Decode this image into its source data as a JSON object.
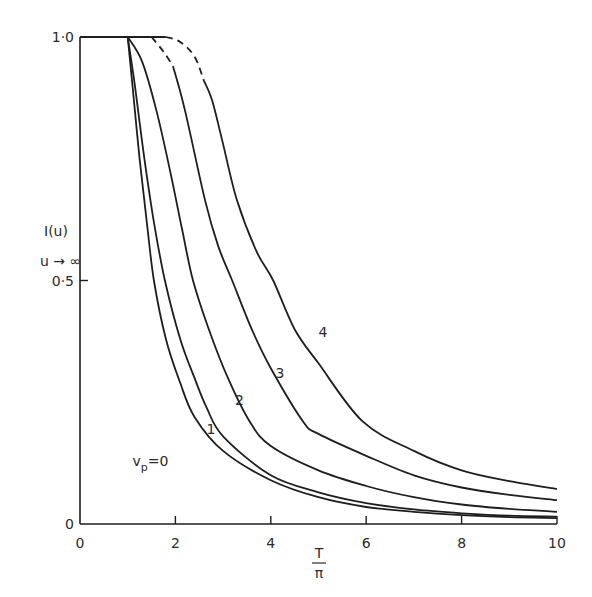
{
  "chart_data": {
    "type": "line",
    "title": "",
    "xlabel_num": "T",
    "xlabel_den": "π",
    "ylabel_line1": "I(u)",
    "ylabel_line2": "u → ∞",
    "xlim": [
      0,
      10
    ],
    "ylim": [
      0,
      1.0
    ],
    "grid": false,
    "x_ticks": [
      0,
      2,
      4,
      6,
      8,
      10
    ],
    "x_tick_labels": [
      "0",
      "2",
      "4",
      "6",
      "8",
      "10"
    ],
    "y_ticks": [
      0,
      0.5,
      1.0
    ],
    "y_tick_labels": [
      "0",
      "0·5",
      "1·0"
    ],
    "plateau": {
      "x": [
        0,
        1.8
      ],
      "y": 1.0
    },
    "series": [
      {
        "name": "v_p=0",
        "label": "vp=0",
        "style": "solid",
        "x": [
          1.0,
          1.1,
          1.25,
          1.4,
          1.55,
          1.8,
          2.1,
          2.4,
          3.0,
          4.0,
          5.0,
          6.0,
          7.0,
          8.0,
          9.0,
          10.0
        ],
        "y": [
          1.0,
          0.9,
          0.75,
          0.62,
          0.5,
          0.38,
          0.29,
          0.22,
          0.15,
          0.09,
          0.055,
          0.035,
          0.025,
          0.018,
          0.014,
          0.012
        ]
      },
      {
        "name": "v_p=1",
        "label": "1",
        "style": "solid",
        "x": [
          1.0,
          1.15,
          1.35,
          1.55,
          1.78,
          2.1,
          2.4,
          2.65,
          3.0,
          4.0,
          5.0,
          6.0,
          7.0,
          8.0,
          9.0,
          10.0
        ],
        "y": [
          1.0,
          0.9,
          0.75,
          0.62,
          0.5,
          0.38,
          0.3,
          0.24,
          0.18,
          0.1,
          0.065,
          0.043,
          0.03,
          0.022,
          0.017,
          0.015
        ]
      },
      {
        "name": "v_p=2",
        "label": "2",
        "style": "solid",
        "x": [
          1.0,
          1.3,
          1.6,
          1.9,
          2.15,
          2.37,
          2.7,
          3.1,
          3.56,
          4.0,
          5.0,
          6.0,
          7.0,
          8.0,
          9.0,
          10.0
        ],
        "y": [
          1.0,
          0.95,
          0.85,
          0.72,
          0.6,
          0.5,
          0.4,
          0.3,
          0.21,
          0.16,
          0.11,
          0.078,
          0.055,
          0.04,
          0.031,
          0.025
        ]
      },
      {
        "name": "v_p=3",
        "label": "3",
        "style": "solid",
        "dashed_prefix": {
          "x": [
            1.5,
            1.75,
            1.95
          ],
          "y": [
            1.0,
            0.97,
            0.94
          ]
        },
        "x": [
          1.95,
          2.2,
          2.62,
          2.9,
          3.19,
          3.6,
          4.0,
          4.68,
          5.0,
          6.0,
          7.0,
          8.0,
          9.0,
          10.0
        ],
        "y": [
          0.94,
          0.85,
          0.665,
          0.57,
          0.5,
          0.4,
          0.32,
          0.21,
          0.185,
          0.14,
          0.1,
          0.075,
          0.06,
          0.049
        ]
      },
      {
        "name": "v_p=4",
        "label": "4",
        "style": "solid",
        "dashed_prefix": {
          "x": [
            1.8,
            2.1,
            2.4,
            2.6
          ],
          "y": [
            1.0,
            0.99,
            0.96,
            0.91
          ]
        },
        "x": [
          2.6,
          2.77,
          3.0,
          3.29,
          3.7,
          4.05,
          4.5,
          5.0,
          5.93,
          7.0,
          8.0,
          9.0,
          10.0
        ],
        "y": [
          0.91,
          0.87,
          0.78,
          0.665,
          0.56,
          0.5,
          0.4,
          0.33,
          0.21,
          0.15,
          0.11,
          0.088,
          0.072
        ]
      }
    ],
    "annotations": [
      {
        "text": "vp=0",
        "x": 1.1,
        "y": 0.12
      },
      {
        "text": "1",
        "x": 2.65,
        "y": 0.185
      },
      {
        "text": "2",
        "x": 3.25,
        "y": 0.245
      },
      {
        "text": "3",
        "x": 4.1,
        "y": 0.3
      },
      {
        "text": "4",
        "x": 5.0,
        "y": 0.385
      }
    ]
  }
}
